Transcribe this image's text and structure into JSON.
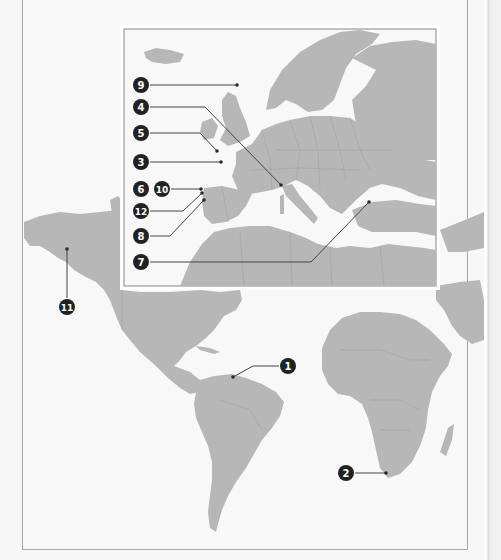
{
  "map": {
    "type": "world reference map with numbered location markers",
    "colors": {
      "land": "#b7b7b7",
      "sea": "#f8f8f8",
      "marker_fill": "#222222",
      "marker_text": "#ffffff",
      "leader_line": "#444444",
      "frame_border": "#a9a9a9"
    },
    "inset": {
      "region": "Europe and Mediterranean",
      "markers": [
        {
          "label": "9",
          "region": "North Sea"
        },
        {
          "label": "4",
          "region": "Northern Italy / Liguria coast"
        },
        {
          "label": "5",
          "region": "English Channel / Brittany"
        },
        {
          "label": "3",
          "region": "Bay of Biscay / Western France"
        },
        {
          "label": "6",
          "region": "Northwest Iberia (Galicia)"
        },
        {
          "label": "10",
          "region": "Northwest Iberia (Galicia)"
        },
        {
          "label": "12",
          "region": "Northwest Iberia"
        },
        {
          "label": "8",
          "region": "Northern Portugal"
        },
        {
          "label": "7",
          "region": "Black Sea southern coast"
        }
      ]
    },
    "world_markers": [
      {
        "label": "11",
        "region": "Alaska"
      },
      {
        "label": "1",
        "region": "Northeastern South America"
      },
      {
        "label": "2",
        "region": "Southern tip of Africa"
      }
    ]
  }
}
